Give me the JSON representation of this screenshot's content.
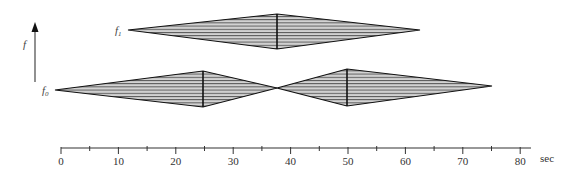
{
  "diagram": {
    "y_axis_label": "f",
    "labels": [
      {
        "id": "f1",
        "base": "f",
        "sub": "1",
        "x": 117,
        "y": 33
      },
      {
        "id": "f0",
        "base": "f",
        "sub": "0",
        "x": 44,
        "y": 93
      }
    ],
    "x_axis": {
      "unit": "sec",
      "ticks": [
        {
          "label": "0",
          "value": 0
        },
        {
          "label": "10",
          "value": 10
        },
        {
          "label": "20",
          "value": 20
        },
        {
          "label": "30",
          "value": 30
        },
        {
          "label": "40",
          "value": 40
        },
        {
          "label": "50",
          "value": 50
        },
        {
          "label": "60",
          "value": 60
        },
        {
          "label": "70",
          "value": 70
        },
        {
          "label": "80",
          "value": 80
        }
      ],
      "minor_step": 5,
      "range": [
        0,
        82
      ]
    },
    "shapes": [
      {
        "name": "f1-diamond",
        "level": "f1",
        "start": 11.7,
        "peak": 37.5,
        "end": 62.5
      },
      {
        "name": "f0-diamond-1",
        "level": "f0",
        "start": -1,
        "peak": 25,
        "end": 37.5
      },
      {
        "name": "f0-diamond-2",
        "level": "f0",
        "start": 37.5,
        "peak": 50,
        "end": 75
      }
    ],
    "colors": {
      "fill": "#cfcfcf",
      "stroke": "#111111",
      "hatch": "#555555"
    }
  }
}
